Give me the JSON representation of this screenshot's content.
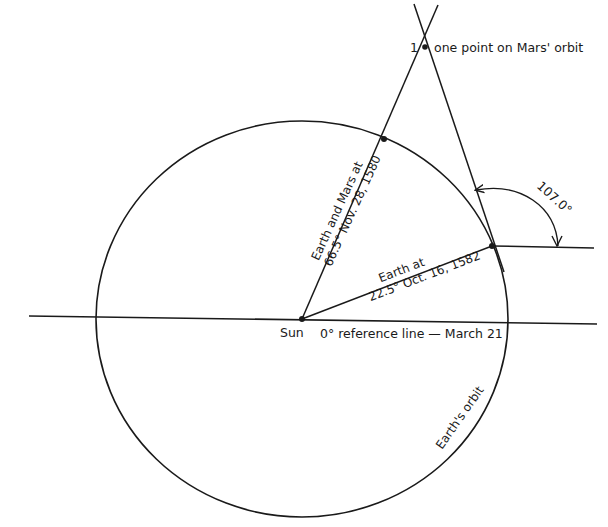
{
  "diagram": {
    "type": "orbital-geometry",
    "colors": {
      "ink": "#1a1a1a",
      "background": "#ffffff"
    },
    "labels": {
      "mars_point_number": "1",
      "mars_point": "one point on Mars' orbit",
      "earth_mars_1580_line1": "Earth and Mars at",
      "earth_mars_1580_line2": "66.5° Nov. 28, 1580",
      "earth_1582_line1": "Earth at",
      "earth_1582_line2": "22.5° Oct. 16, 1582",
      "angle": "107.0°",
      "sun": "Sun",
      "reference_line": "0° reference line — March 21",
      "earth_orbit": "Earth's orbit"
    },
    "points": {
      "sun": {
        "x": 302,
        "y": 319
      },
      "earth_1580": {
        "x": 384,
        "y": 139
      },
      "earth_1582": {
        "x": 492,
        "y": 246
      },
      "mars_point_1": {
        "x": 425,
        "y": 47
      }
    },
    "angles": {
      "earth_1580_deg": 66.5,
      "earth_1582_deg": 22.5,
      "sight_line_angle_deg": 107.0
    }
  }
}
